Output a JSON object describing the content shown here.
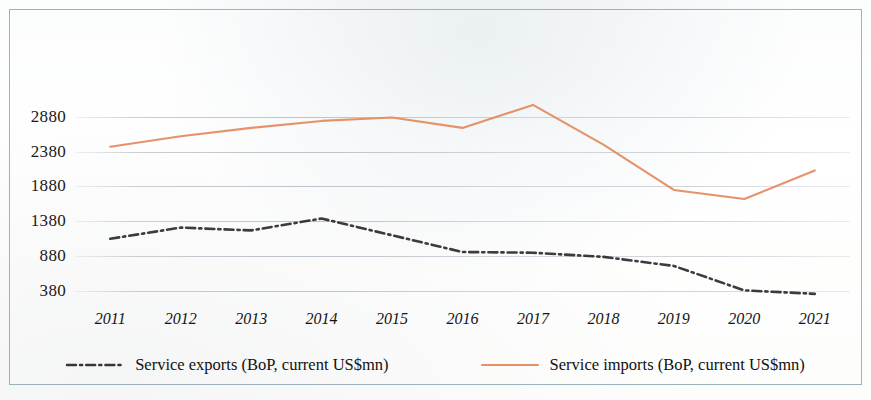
{
  "chart_data": {
    "type": "line",
    "title": "",
    "subtitle": "",
    "xlabel": "",
    "ylabel": "",
    "categories": [
      "2011",
      "2012",
      "2013",
      "2014",
      "2015",
      "2016",
      "2017",
      "2018",
      "2019",
      "2020",
      "2021"
    ],
    "x": [
      2011,
      2012,
      2013,
      2014,
      2015,
      2016,
      2017,
      2018,
      2019,
      2020,
      2021
    ],
    "ylim": [
      180,
      3120
    ],
    "yticks": [
      380,
      880,
      1380,
      1880,
      2380,
      2880
    ],
    "ytick_labels": [
      "380",
      "880",
      "1380",
      "1880",
      "2380",
      "2880"
    ],
    "grid": true,
    "legend_position": "bottom",
    "series": [
      {
        "name": "Service exports (BoP, current US$mn)",
        "style": "dash-dot",
        "color": "#1c1c1c",
        "values": [
          1130,
          1290,
          1250,
          1420,
          1180,
          940,
          930,
          870,
          740,
          390,
          340
        ]
      },
      {
        "name": "Service imports (BoP, current US$mn)",
        "style": "solid",
        "color": "#E38A5E",
        "values": [
          2450,
          2600,
          2720,
          2820,
          2870,
          2720,
          3050,
          2480,
          1830,
          1700,
          2110
        ]
      }
    ]
  },
  "legend": {
    "items": [
      {
        "label": "Service exports (BoP, current US$mn)",
        "marker": "dash-dot-line-swatch",
        "color": "#1c1c1c"
      },
      {
        "label": "Service imports (BoP, current US$mn)",
        "marker": "solid-line-swatch",
        "color": "#E38A5E"
      }
    ]
  },
  "colors": {
    "exports_line": "#1c1c1c",
    "imports_line": "#E38A5E",
    "gridline": "#a9b2bc",
    "frame_border": "#9fb3bd",
    "axis_text": "#141414",
    "background": "#ffffff"
  }
}
